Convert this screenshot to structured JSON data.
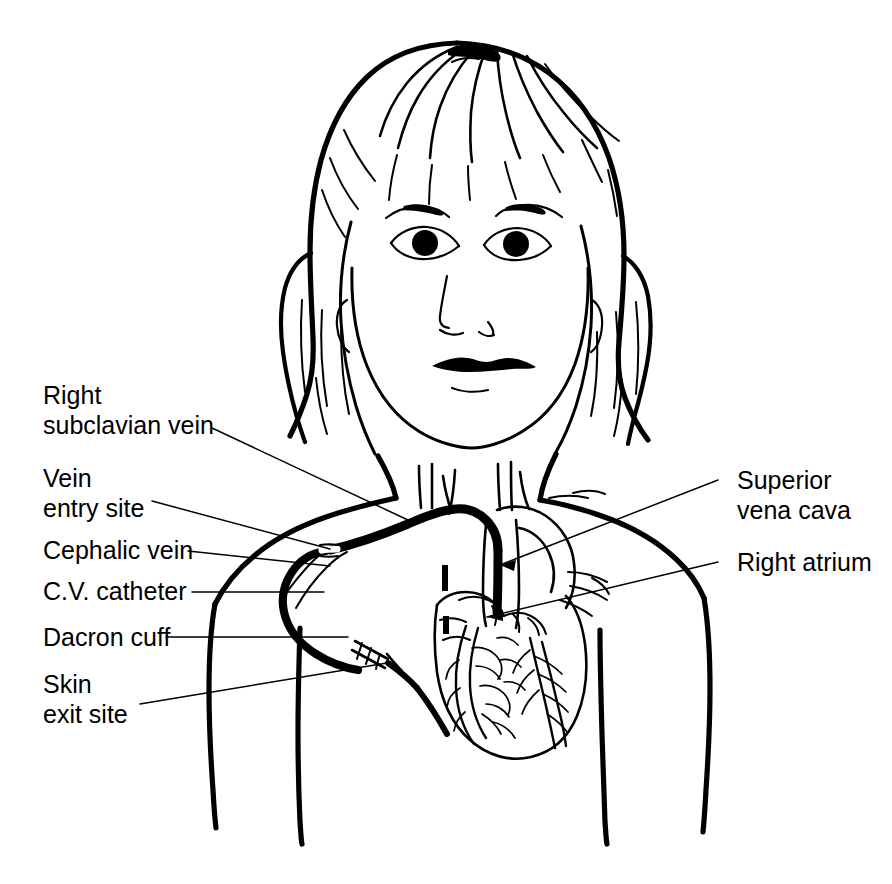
{
  "figure": {
    "background_color": "#ffffff",
    "ink_color": "#000000",
    "style": "black-and-white line drawing"
  },
  "labels": {
    "left": [
      {
        "name": "right-subclavian-vein",
        "line1": "Right",
        "line2": "subclavian vein",
        "points_to": "subclavian vein at clavicle"
      },
      {
        "name": "vein-entry-site",
        "line1": "Vein",
        "line2": "entry site",
        "points_to": "catheter entry into vein"
      },
      {
        "name": "cephalic-vein",
        "line1": "Cephalic vein",
        "line2": "",
        "points_to": "cephalic vein on shoulder"
      },
      {
        "name": "cv-catheter",
        "line1": "C.V. catheter",
        "line2": "",
        "points_to": "catheter tunnel under skin"
      },
      {
        "name": "dacron-cuff",
        "line1": "Dacron cuff",
        "line2": "",
        "points_to": "cuff on catheter"
      },
      {
        "name": "skin-exit-site",
        "line1": "Skin",
        "line2": "exit site",
        "points_to": "catheter exit through skin"
      }
    ],
    "right": [
      {
        "name": "superior-vena-cava",
        "line1": "Superior",
        "line2": "vena cava",
        "points_to": "superior vena cava"
      },
      {
        "name": "right-atrium",
        "line1": "Right atrium",
        "line2": "",
        "points_to": "right atrium of heart"
      }
    ]
  },
  "anatomy": {
    "parts": [
      "head",
      "hair",
      "face",
      "eyes",
      "eyebrows",
      "nose",
      "mouth",
      "neck",
      "shoulders",
      "torso",
      "arms",
      "heart",
      "coronary-vessels",
      "aortic-arch",
      "superior-vena-cava",
      "subclavian-vein",
      "cephalic-vein",
      "brachiocephalic-vessels"
    ]
  },
  "device": {
    "name": "C.V. catheter",
    "components": [
      "intravascular-tip",
      "tunneled-segment",
      "dacron-cuff",
      "external-segment"
    ]
  }
}
